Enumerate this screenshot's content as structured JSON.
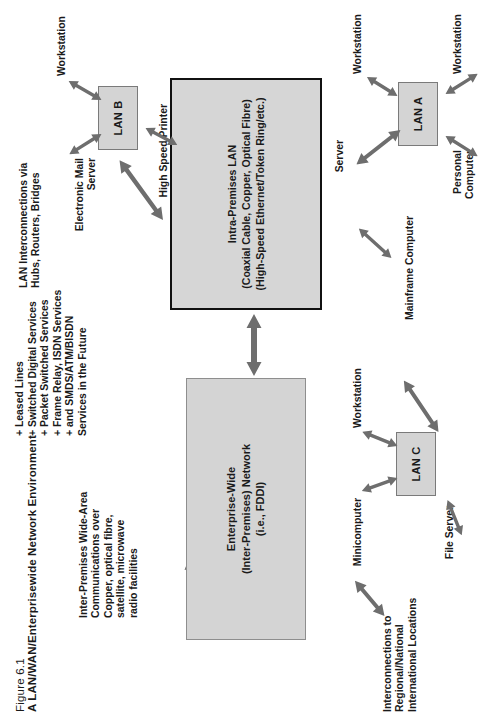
{
  "figure": {
    "number": "Figure 6.1",
    "title": "A LAN/WAN/Enterprisewide Network Environment"
  },
  "annotations": {
    "interconnections": "Interconnections to\nRegional/National\nInternational Locations",
    "wan_media": "Inter-Premises Wide-Area\nCommunications over\nCopper, optical fibre,\nsatellite, microwave\nradio facilities",
    "wan_services": "+ Leased Lines\n+ Switched Digital Services\n+ Packet Switched Services\n+ Frame Relay, ISDN Services\n+ and SMDS/ATM/BISDN\n    Services in the Future",
    "lan_interconnections": "LAN Interconnections via\nHubs, Routers, Bridges"
  },
  "boxes": {
    "enterprise": "Enterprise-Wide\n(Inter-Premises) Network\n(i.e., FDDI)",
    "intra_premises": "Intra-Premises LAN\n(Coaxial Cable, Copper, Optical Fibre)\n(High-Speed Ethernet/Token Ring/etc.)",
    "lan_a": "LAN A",
    "lan_b": "LAN B",
    "lan_c": "LAN C"
  },
  "nodes": {
    "mainframe": "Mainframe Computer",
    "file_server": "File Server",
    "minicomputer": "Minicomputer",
    "workstation_c": "Workstation",
    "server_a": "Server",
    "workstation_a1": "Workstation",
    "workstation_a2": "Workstation",
    "personal_computer": "Personal\nComputer",
    "email_server": "Electronic Mail\nServer",
    "workstation_b": "Workstation",
    "printer_b": "High Speed Printer"
  },
  "colors": {
    "box_fill": "#d4d4d4",
    "box_border": "#7a7a7a",
    "box_border_thick": "#111111",
    "arrow": "#6e6e6e",
    "text": "#1a1a1a",
    "background": "#ffffff"
  }
}
